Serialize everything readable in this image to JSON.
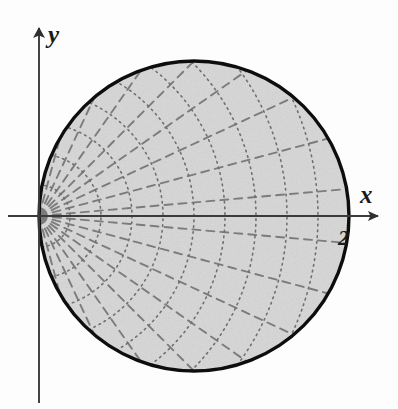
{
  "figure": {
    "axis_x_label": "x",
    "axis_y_label": "y",
    "boundary_label": "2",
    "colors": {
      "disk_fill": "#d7d7d7",
      "disk_border": "#111111",
      "axis": "#3a3a3a",
      "grid_arc": "#6f6f6f",
      "grid_ray": "#7b7b7b",
      "background": "#fdfdfd"
    }
  },
  "chart_data": {
    "type": "line",
    "xlabel": "x",
    "ylabel": "y",
    "grid": true,
    "legend": null,
    "xlim": [
      -0.25,
      2.45
    ],
    "ylim": [
      -1.25,
      1.25
    ],
    "origin_px": [
      39,
      216
    ],
    "pixels_per_unit": 155,
    "region": {
      "name": "disk tangent to y-axis at origin",
      "polar_equation": "r = 2 cos(theta)",
      "cartesian_equation": "(x - 1)^2 + y^2 = 1",
      "center": [
        1,
        0
      ],
      "radius": 1,
      "diameter_along_x": 2,
      "theta_range": [
        -1.5707963,
        1.5707963
      ],
      "tangent_point": [
        0,
        0
      ],
      "rightmost_point": [
        2,
        0
      ]
    },
    "series": [
      {
        "name": "disk boundary",
        "style": "solid",
        "linewidth": 3.2,
        "color": "#111111",
        "closed": true
      },
      {
        "name": "constant-r arcs",
        "style": "dotted",
        "color": "#6f6f6f",
        "linewidth": 1.5,
        "description": "concentric circular arcs centered at the origin, clipped to the disk",
        "r_values": [
          0.2,
          0.4,
          0.6,
          0.8,
          1.0,
          1.2,
          1.4,
          1.6,
          1.8,
          2.0
        ]
      },
      {
        "name": "constant-theta rays",
        "style": "dashed",
        "color": "#7b7b7b",
        "linewidth": 1.8,
        "description": "straight rays from the origin out to the boundary r = 2 cos(theta)",
        "theta_values_deg": [
          -85,
          -75,
          -65,
          -55,
          -45,
          -35,
          -25,
          -15,
          -5,
          5,
          15,
          25,
          35,
          45,
          55,
          65,
          75,
          85
        ]
      }
    ],
    "annotations": [
      {
        "text": "2",
        "x": 2.0,
        "y": -0.12,
        "note": "boundary crossing of the x-axis"
      },
      {
        "text": "x",
        "x": 2.25,
        "y": 0.22,
        "note": "x-axis arrow label"
      },
      {
        "text": "y",
        "x": 0.06,
        "y": 1.2,
        "note": "y-axis arrow label"
      }
    ],
    "axes": {
      "x_axis_from_px": [
        8,
        216
      ],
      "x_axis_to_px": [
        384,
        216
      ],
      "y_axis_from_px": [
        39,
        403
      ],
      "y_axis_to_px": [
        39,
        22
      ],
      "arrowheads": [
        "x-positive",
        "y-positive"
      ]
    }
  }
}
